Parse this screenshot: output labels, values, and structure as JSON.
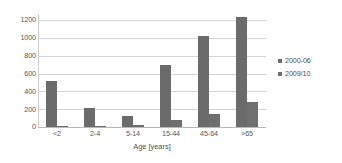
{
  "chart_data": {
    "type": "bar",
    "title": "",
    "xlabel": "Age [years]",
    "ylabel": "",
    "categories": [
      "<2",
      "2-4",
      "5-14",
      "15-44",
      "45-64",
      ">65"
    ],
    "series": [
      {
        "name": "2000-06",
        "values": [
          550,
          230,
          130,
          730,
          1075,
          1300
        ],
        "color": "#6b6b6b"
      },
      {
        "name": "2009/10",
        "values": [
          10,
          15,
          25,
          85,
          155,
          300
        ],
        "color": "#6f6f6f"
      }
    ],
    "yticks": [
      0,
      200,
      400,
      600,
      800,
      1000,
      1200
    ],
    "ylim": [
      0,
      1200
    ],
    "ymax_draw": 1340,
    "grid": true,
    "legend_position": "right"
  },
  "axis": {
    "y_labels": [
      "1200",
      "1000",
      "800",
      "600",
      "400",
      "200",
      "0"
    ],
    "x_labels": [
      "<2",
      "2-4",
      "5-14",
      "15-44",
      "45-64",
      ">65"
    ],
    "x_title": "Age [years]"
  },
  "legend": {
    "items": [
      {
        "label": "2000-06"
      },
      {
        "label": "2009/10"
      }
    ]
  }
}
